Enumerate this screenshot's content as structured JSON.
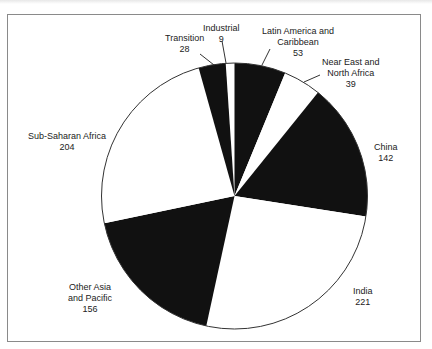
{
  "chart_data": {
    "type": "pie",
    "title": "",
    "center": [
      234.5,
      196
    ],
    "radius": 133,
    "start_angle_deg": -3.8,
    "direction": "clockwise",
    "colors": {
      "dark": "#111111",
      "light": "#ffffff",
      "outline": "#333333"
    },
    "slices": [
      {
        "name": "Industrial",
        "value": 9,
        "fill": "light"
      },
      {
        "name": "Latin America and Caribbean",
        "value": 53,
        "fill": "dark"
      },
      {
        "name": "Near East and North Africa",
        "value": 39,
        "fill": "light"
      },
      {
        "name": "China",
        "value": 142,
        "fill": "dark"
      },
      {
        "name": "India",
        "value": 221,
        "fill": "light"
      },
      {
        "name": "Other Asia and Pacific",
        "value": 156,
        "fill": "dark"
      },
      {
        "name": "Sub-Saharan Africa",
        "value": 204,
        "fill": "light"
      },
      {
        "name": "Transition",
        "value": 28,
        "fill": "dark"
      }
    ],
    "total": 852
  },
  "labels": {
    "industrial": {
      "line1": "Industrial",
      "value": "9"
    },
    "latin": {
      "line1": "Latin America and",
      "line2": "Caribbean",
      "value": "53"
    },
    "neareast": {
      "line1": "Near East and",
      "line2": "North Africa",
      "value": "39"
    },
    "china": {
      "line1": "China",
      "value": "142"
    },
    "india": {
      "line1": "India",
      "value": "221"
    },
    "otherasia": {
      "line1": "Other Asia",
      "line2": "and Pacific",
      "value": "156"
    },
    "subsaharan": {
      "line1": "Sub-Saharan Africa",
      "value": "204"
    },
    "transition": {
      "line1": "Transition",
      "value": "28"
    }
  }
}
